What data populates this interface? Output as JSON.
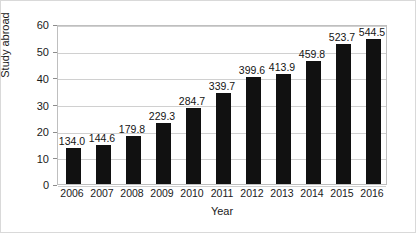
{
  "chart_data": {
    "type": "bar",
    "title": "",
    "xlabel": "Year",
    "ylabel": "Study abroad",
    "categories": [
      "2006",
      "2007",
      "2008",
      "2009",
      "2010",
      "2011",
      "2012",
      "2013",
      "2014",
      "2015",
      "2016"
    ],
    "values": [
      13.4,
      14.46,
      17.98,
      22.93,
      28.47,
      33.97,
      39.96,
      41.39,
      45.98,
      52.37,
      54.45
    ],
    "data_labels": [
      "134.0",
      "144.6",
      "179.8",
      "229.3",
      "284.7",
      "339.7",
      "399.6",
      "413.9",
      "459.8",
      "523.7",
      "544.5"
    ],
    "ylim": [
      0,
      60
    ],
    "yticks": [
      "0",
      "10",
      "20",
      "30",
      "40",
      "50",
      "60"
    ],
    "grid": true,
    "legend": "none",
    "bar_color": "#111111"
  }
}
